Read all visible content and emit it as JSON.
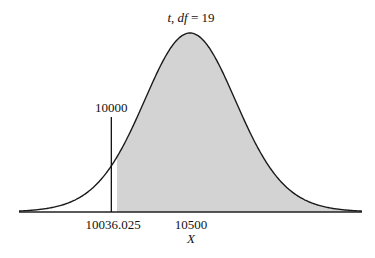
{
  "chart_data": {
    "type": "area",
    "title": "t, df = 19",
    "title_parts": {
      "var": "t",
      "df_label": "df",
      "df_value": "19"
    },
    "distribution": "Student t",
    "df": 19,
    "xlabel": "X",
    "ylabel": "",
    "center": 10500,
    "scale_per_t": 301,
    "x_range": [
      8900,
      11700
    ],
    "tick_labels": [
      {
        "value": 10036.025,
        "label": "10036.025"
      },
      {
        "value": 10500,
        "label": "10500"
      }
    ],
    "reference_line": {
      "value": 10000,
      "label": "10000"
    },
    "shaded_region": {
      "from": 10036.025,
      "to": "+inf",
      "color": "#d3d3d3"
    },
    "grid": false,
    "legend": "none"
  },
  "colors": {
    "curve": "#1a1a1a",
    "shade": "#d3d3d3",
    "axis": "#222222",
    "background": "#ffffff"
  }
}
